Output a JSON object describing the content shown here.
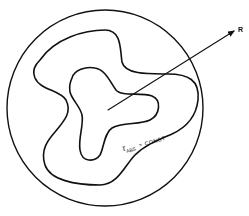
{
  "diagram": {
    "type": "contour-schematic",
    "arrow_label": "R",
    "contour_label": {
      "symbol": "τ",
      "subscript": "ABS",
      "relation": "= CONST"
    },
    "elements": [
      "outer-circle-boundary",
      "outer-irregular-contour",
      "inner-three-lobed-contour",
      "radial-arrow"
    ],
    "colors": {
      "stroke": "#111111",
      "background": "#ffffff"
    }
  }
}
